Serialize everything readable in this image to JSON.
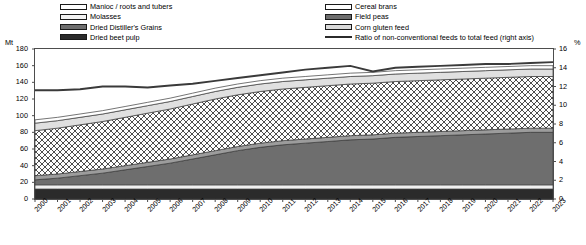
{
  "legend": {
    "left_column": [
      {
        "label": "Manioc / roots and tubers",
        "swatch": "white-swatch"
      },
      {
        "label": "Molasses",
        "swatch": "very-light-gray-swatch"
      },
      {
        "label": "Dried Distiller's Grains",
        "swatch": "mid-gray-swatch"
      },
      {
        "label": "Dried beet pulp",
        "swatch": "dark-gray-swatch"
      }
    ],
    "right_column": [
      {
        "label": "Cereal brans",
        "swatch": "hatched-swatch"
      },
      {
        "label": "Field peas",
        "swatch": "mid-gray-swatch"
      },
      {
        "label": "Corn gluten feed",
        "swatch": "light-gray-swatch"
      },
      {
        "label": "Ratio of non-conventional feeds to total feed (right axis)",
        "swatch": "line-swatch"
      }
    ]
  },
  "axes": {
    "left_unit": "Mt",
    "right_unit": "%",
    "left_ticks": [
      "0",
      "20",
      "40",
      "60",
      "80",
      "100",
      "120",
      "140",
      "160",
      "180"
    ],
    "right_ticks": [
      "0",
      "2",
      "4",
      "6",
      "8",
      "10",
      "12",
      "14",
      "16"
    ]
  },
  "chart_data": {
    "type": "area",
    "title": "",
    "xlabel": "",
    "ylabel": "Mt",
    "y2label": "%",
    "ylim": [
      0,
      180
    ],
    "y2lim": [
      0,
      16
    ],
    "grid": false,
    "legend_position": "top",
    "categories": [
      "2000",
      "2001",
      "2002",
      "2003",
      "2004",
      "2005",
      "2006",
      "2007",
      "2008",
      "2009",
      "2010",
      "2011",
      "2012",
      "2013",
      "2014",
      "2015",
      "2016",
      "2017",
      "2018",
      "2019",
      "2020",
      "2021",
      "2022",
      "2023"
    ],
    "stack_order_bottom_to_top": [
      "Dried beet pulp",
      "Molasses",
      "Dried Distiller's Grains",
      "Field peas",
      "Cereal brans",
      "Corn gluten feed",
      "Manioc / roots and tubers"
    ],
    "series": [
      {
        "name": "Dried beet pulp",
        "values": [
          12,
          12,
          12,
          12,
          12,
          12,
          12,
          12,
          12,
          12,
          12,
          12,
          12,
          12,
          12,
          12,
          12,
          12,
          12,
          12,
          12,
          12,
          12,
          12
        ]
      },
      {
        "name": "Molasses",
        "values": [
          5,
          5,
          5,
          5,
          5,
          5,
          5,
          5,
          5,
          5,
          5,
          5,
          5,
          5,
          5,
          5,
          5,
          5,
          5,
          5,
          5,
          5,
          5,
          5
        ]
      },
      {
        "name": "Dried Distiller's Grains",
        "values": [
          6,
          8,
          11,
          14,
          18,
          22,
          26,
          31,
          36,
          41,
          45,
          48,
          50,
          52,
          54,
          55,
          57,
          58,
          59,
          60,
          61,
          62,
          63,
          63
        ]
      },
      {
        "name": "Field peas",
        "values": [
          5,
          5,
          5,
          5,
          5,
          5,
          5,
          5,
          5,
          5,
          5,
          5,
          5,
          5,
          5,
          5,
          5,
          5,
          5,
          5,
          5,
          5,
          5,
          5
        ]
      },
      {
        "name": "Cereal brans",
        "values": [
          54,
          55,
          56,
          57,
          58,
          59,
          60,
          61,
          62,
          62,
          62,
          62,
          62,
          62,
          62,
          62,
          62,
          62,
          62,
          62,
          62,
          62,
          62,
          62
        ]
      },
      {
        "name": "Corn gluten feed",
        "values": [
          9,
          9,
          9,
          9,
          9,
          9,
          9,
          9,
          9,
          9,
          9,
          9,
          9,
          9,
          9,
          9,
          9,
          9,
          9,
          9,
          9,
          9,
          9,
          9
        ]
      },
      {
        "name": "Manioc / roots and tubers",
        "values": [
          4,
          4,
          4,
          4,
          4,
          4,
          4,
          4,
          4,
          4,
          4,
          4,
          4,
          4,
          4,
          4,
          4,
          4,
          4,
          4,
          4,
          4,
          4,
          4
        ]
      }
    ],
    "totals": [
      95,
      98,
      102,
      106,
      111,
      116,
      121,
      127,
      133,
      138,
      142,
      145,
      147,
      149,
      151,
      152,
      154,
      155,
      156,
      157,
      158,
      159,
      160,
      160
    ],
    "ratio_line": {
      "name": "Ratio of non-conventional feeds to total feed (right axis)",
      "axis": "right",
      "unit": "%",
      "values": [
        11.6,
        11.6,
        11.7,
        12.0,
        12.0,
        11.9,
        12.1,
        12.3,
        12.6,
        12.9,
        13.2,
        13.5,
        13.8,
        14.0,
        14.2,
        13.6,
        14.0,
        14.1,
        14.2,
        14.3,
        14.4,
        14.4,
        14.5,
        14.6
      ]
    }
  }
}
